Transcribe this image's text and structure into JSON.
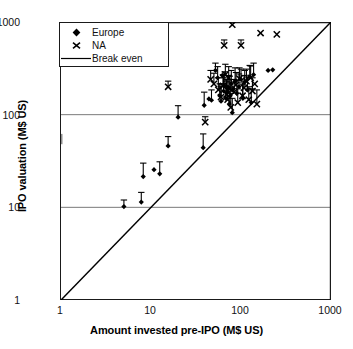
{
  "chart_data": {
    "type": "scatter",
    "title": "",
    "xlabel": "Amount invested pre-IPO (M$ US)",
    "ylabel": "IPO valuation (M$ US)",
    "xscale": "log",
    "yscale": "log",
    "xlim": [
      1,
      1000
    ],
    "ylim": [
      1,
      1000
    ],
    "xticks": [
      1,
      10,
      100,
      1000
    ],
    "yticks": [
      1,
      10,
      100,
      1000
    ],
    "xticklabels": [
      "1",
      "10",
      "100",
      "1000"
    ],
    "yticklabels": [
      "1",
      "10",
      "100",
      "1000"
    ],
    "grid": "horizontal-at-10-and-100",
    "legend_position": "upper-left-inside",
    "errorbars": "upper only (asymmetric, drawn upward from marker)",
    "series": [
      {
        "name": "Europe",
        "marker": "diamond",
        "color": "#000000",
        "points": [
          {
            "x": 5.0,
            "y": 10.2,
            "yerr_hi": 12.0
          },
          {
            "x": 7.8,
            "y": 11.4,
            "yerr_hi": 14.5
          },
          {
            "x": 8.2,
            "y": 21.5,
            "yerr_hi": 30.0
          },
          {
            "x": 10.8,
            "y": 25.5,
            "yerr_hi": 25.5
          },
          {
            "x": 12.5,
            "y": 23.0,
            "yerr_hi": 31.0
          },
          {
            "x": 15.5,
            "y": 46.0,
            "yerr_hi": 58.0
          },
          {
            "x": 20.0,
            "y": 94.0,
            "yerr_hi": 125.0
          },
          {
            "x": 38.0,
            "y": 44.0,
            "yerr_hi": 62.0
          },
          {
            "x": 39.0,
            "y": 126.0,
            "yerr_hi": 175.0
          },
          {
            "x": 44.0,
            "y": 148.0,
            "yerr_hi": 148.0
          },
          {
            "x": 47.0,
            "y": 143.0,
            "yerr_hi": 185.0
          },
          {
            "x": 52.0,
            "y": 300.0,
            "yerr_hi": 360.0
          },
          {
            "x": 55.0,
            "y": 250.0,
            "yerr_hi": 330.0
          },
          {
            "x": 58.0,
            "y": 160.0,
            "yerr_hi": 215.0
          },
          {
            "x": 60.0,
            "y": 140.0,
            "yerr_hi": 200.0
          },
          {
            "x": 62.0,
            "y": 265.0,
            "yerr_hi": 265.0
          },
          {
            "x": 64.0,
            "y": 180.0,
            "yerr_hi": 250.0
          },
          {
            "x": 66.0,
            "y": 205.0,
            "yerr_hi": 290.0
          },
          {
            "x": 68.0,
            "y": 150.0,
            "yerr_hi": 205.0
          },
          {
            "x": 70.0,
            "y": 175.0,
            "yerr_hi": 240.0
          },
          {
            "x": 72.0,
            "y": 195.0,
            "yerr_hi": 265.0
          },
          {
            "x": 74.0,
            "y": 130.0,
            "yerr_hi": 180.0
          },
          {
            "x": 76.0,
            "y": 160.0,
            "yerr_hi": 225.0
          },
          {
            "x": 78.0,
            "y": 215.0,
            "yerr_hi": 300.0
          },
          {
            "x": 80.0,
            "y": 105.0,
            "yerr_hi": 150.0
          },
          {
            "x": 82.0,
            "y": 190.0,
            "yerr_hi": 190.0
          },
          {
            "x": 86.0,
            "y": 230.0,
            "yerr_hi": 320.0
          },
          {
            "x": 90.0,
            "y": 170.0,
            "yerr_hi": 235.0
          },
          {
            "x": 95.0,
            "y": 200.0,
            "yerr_hi": 275.0
          },
          {
            "x": 100.0,
            "y": 240.0,
            "yerr_hi": 310.0
          },
          {
            "x": 105.0,
            "y": 150.0,
            "yerr_hi": 210.0
          },
          {
            "x": 110.0,
            "y": 225.0,
            "yerr_hi": 300.0
          },
          {
            "x": 118.0,
            "y": 185.0,
            "yerr_hi": 255.0
          },
          {
            "x": 125.0,
            "y": 255.0,
            "yerr_hi": 340.0
          },
          {
            "x": 130.0,
            "y": 135.0,
            "yerr_hi": 190.0
          },
          {
            "x": 138.0,
            "y": 270.0,
            "yerr_hi": 360.0
          },
          {
            "x": 200.0,
            "y": 300.0,
            "yerr_hi": 300.0
          },
          {
            "x": 225.0,
            "y": 305.0,
            "yerr_hi": 305.0
          }
        ]
      },
      {
        "name": "NA",
        "marker": "x",
        "color": "#000000",
        "points": [
          {
            "x": 15.5,
            "y": 200.0,
            "yerr_hi": 230.0
          },
          {
            "x": 40.0,
            "y": 83.0,
            "yerr_hi": 95.0
          },
          {
            "x": 46.0,
            "y": 240.0,
            "yerr_hi": 300.0
          },
          {
            "x": 50.0,
            "y": 215.0,
            "yerr_hi": 280.0
          },
          {
            "x": 56.0,
            "y": 185.0,
            "yerr_hi": 250.0
          },
          {
            "x": 60.0,
            "y": 155.0,
            "yerr_hi": 215.0
          },
          {
            "x": 63.0,
            "y": 205.0,
            "yerr_hi": 270.0
          },
          {
            "x": 65.0,
            "y": 560.0,
            "yerr_hi": 640.0
          },
          {
            "x": 67.0,
            "y": 270.0,
            "yerr_hi": 350.0
          },
          {
            "x": 69.0,
            "y": 165.0,
            "yerr_hi": 230.0
          },
          {
            "x": 71.0,
            "y": 145.0,
            "yerr_hi": 200.0
          },
          {
            "x": 73.0,
            "y": 250.0,
            "yerr_hi": 330.0
          },
          {
            "x": 75.0,
            "y": 190.0,
            "yerr_hi": 260.0
          },
          {
            "x": 77.0,
            "y": 120.0,
            "yerr_hi": 170.0
          },
          {
            "x": 80.0,
            "y": 935.0,
            "yerr_hi": 935.0
          },
          {
            "x": 84.0,
            "y": 175.0,
            "yerr_hi": 240.0
          },
          {
            "x": 88.0,
            "y": 210.0,
            "yerr_hi": 285.0
          },
          {
            "x": 92.0,
            "y": 135.0,
            "yerr_hi": 190.0
          },
          {
            "x": 96.0,
            "y": 245.0,
            "yerr_hi": 320.0
          },
          {
            "x": 100.0,
            "y": 560.0,
            "yerr_hi": 640.0
          },
          {
            "x": 104.0,
            "y": 160.0,
            "yerr_hi": 220.0
          },
          {
            "x": 108.0,
            "y": 195.0,
            "yerr_hi": 265.0
          },
          {
            "x": 115.0,
            "y": 230.0,
            "yerr_hi": 310.0
          },
          {
            "x": 122.0,
            "y": 145.0,
            "yerr_hi": 200.0
          },
          {
            "x": 128.0,
            "y": 250.0,
            "yerr_hi": 335.0
          },
          {
            "x": 134.0,
            "y": 180.0,
            "yerr_hi": 250.0
          },
          {
            "x": 142.0,
            "y": 215.0,
            "yerr_hi": 215.0
          },
          {
            "x": 150.0,
            "y": 130.0,
            "yerr_hi": 185.0
          },
          {
            "x": 165.0,
            "y": 760.0,
            "yerr_hi": 760.0
          },
          {
            "x": 250.0,
            "y": 735.0,
            "yerr_hi": 735.0
          }
        ]
      }
    ],
    "reference_line": {
      "name": "Break even",
      "from": [
        1,
        1
      ],
      "to": [
        1000,
        1000
      ],
      "style": "solid",
      "color": "#000000"
    },
    "legend": [
      {
        "label": "Europe",
        "marker": "diamond"
      },
      {
        "label": "NA",
        "marker": "x"
      },
      {
        "label": "Break even",
        "marker": "line"
      }
    ]
  }
}
